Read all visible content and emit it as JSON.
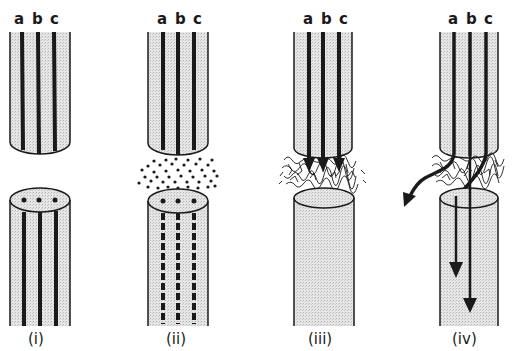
{
  "diagram": {
    "fiber_labels": [
      "a",
      "b",
      "c"
    ],
    "panels": [
      {
        "id": "i",
        "caption": "(i)",
        "description": "Cut nerve: proximal stump with intact axons a, b, c; distal stump with axon ends shown as dots"
      },
      {
        "id": "ii",
        "caption": "(ii)",
        "description": "Gap filled with debris/cells; distal axons degenerate (dashed)"
      },
      {
        "id": "iii",
        "caption": "(iii)",
        "description": "Scar tissue forms; axon sprouts grow toward gap (arrows)"
      },
      {
        "id": "iv",
        "caption": "(iv)",
        "description": "Axons regrow through scar; some misdirected (curved arrow out), others reach distal stump"
      }
    ],
    "colors": {
      "ink": "#1a1a1a",
      "stipple": "#d9d9d9",
      "background": "#ffffff"
    }
  }
}
